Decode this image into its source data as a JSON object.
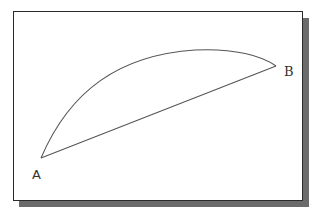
{
  "diagram": {
    "title": "",
    "points": [
      {
        "id": "A",
        "label": "A",
        "x": 41,
        "y": 158
      },
      {
        "id": "B",
        "label": "B",
        "x": 276,
        "y": 66
      }
    ],
    "curves": [
      {
        "type": "arc",
        "from": "A",
        "to": "B",
        "peak": {
          "x": 200,
          "y": 50
        }
      },
      {
        "type": "line",
        "from": "A",
        "to": "B"
      }
    ],
    "colors": {
      "line": "#555555",
      "frame_border": "#2a2a2a",
      "shadow": "#6b6b6b",
      "background": "#ffffff"
    }
  }
}
